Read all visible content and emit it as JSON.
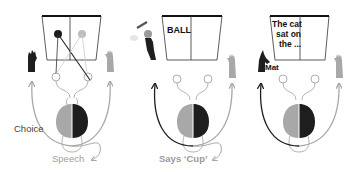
{
  "colors": {
    "dark": "#1e1e1e",
    "light": "#a8a8a8",
    "line": "#333333",
    "speech_label": "#9a9a9a"
  },
  "panels": [
    {
      "id": "panel-1",
      "screen_text": "",
      "labels": {
        "choice": "Choice",
        "speech": "Speech"
      }
    },
    {
      "id": "panel-2",
      "screen_text": "BALL",
      "labels": {
        "speech": "Says ‘Cup’"
      }
    },
    {
      "id": "panel-3",
      "screen_text_lines": [
        "The cat",
        "sat on",
        "the ..."
      ],
      "labels": {
        "response": "Mat"
      }
    }
  ]
}
